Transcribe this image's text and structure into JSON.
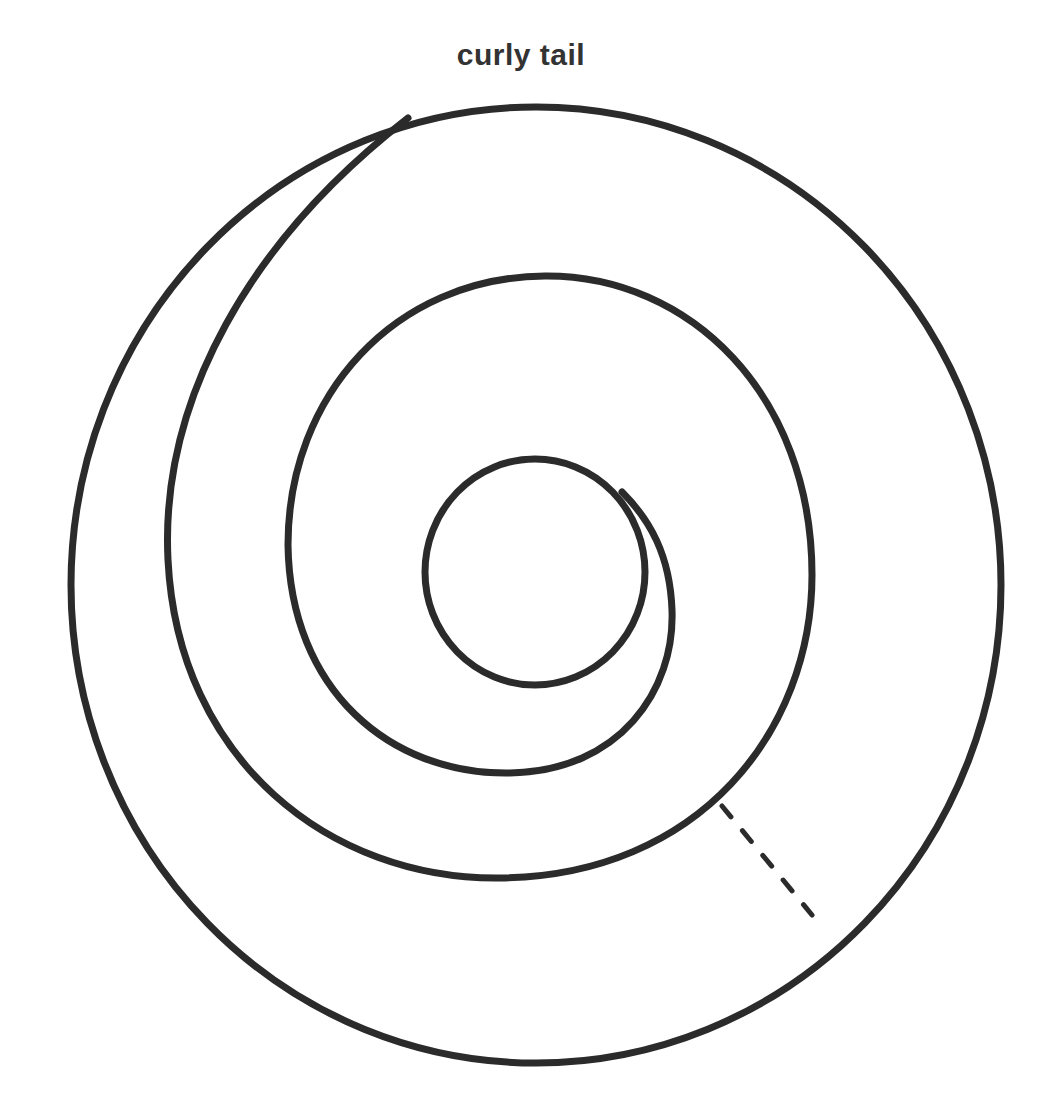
{
  "figure": {
    "title": "curly tail",
    "colors": {
      "background": "#ffffff",
      "stroke": "#2b2b2b",
      "title": "#333333"
    },
    "elements": [
      {
        "name": "outer-circle",
        "type": "closed curve",
        "style": "solid"
      },
      {
        "name": "spiral-outer-turn",
        "type": "curve",
        "style": "solid",
        "note": "merges into outer circle at top-left"
      },
      {
        "name": "spiral-middle-turn",
        "type": "curve",
        "style": "solid"
      },
      {
        "name": "inner-loop",
        "type": "closed curve",
        "style": "solid",
        "note": "tangent to spiral at upper right"
      },
      {
        "name": "dashed-connector",
        "type": "line segment",
        "style": "dashed",
        "note": "from spiral to outer circle at lower right"
      }
    ]
  }
}
